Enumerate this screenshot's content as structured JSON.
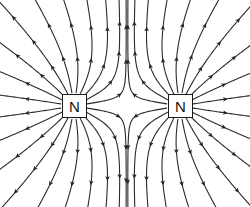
{
  "figure": {
    "name": "magnetic-field-like-poles",
    "background_color": "#ffffff",
    "line_color": "#2b2b2b",
    "width": 250,
    "height": 207
  },
  "poles": [
    {
      "id": "left-pole",
      "label": "N",
      "polarity": "north",
      "cx": 74,
      "cy": 106,
      "box": {
        "x": 62,
        "y": 94,
        "w": 25,
        "h": 24
      },
      "border_color": "#1a1a1a",
      "fill_color": "#ffffff",
      "text_color": "#111111"
    },
    {
      "id": "right-pole",
      "label": "N",
      "polarity": "north",
      "cx": 180,
      "cy": 106,
      "box": {
        "x": 168,
        "y": 94,
        "w": 25,
        "h": 24
      },
      "border_color": "#1a1a1a",
      "fill_color": "#ffffff",
      "text_color": "#111111"
    }
  ],
  "chart_data": {
    "type": "diagram",
    "title": "",
    "subtitle": "",
    "neutral_point": {
      "x": 127,
      "y": 106
    },
    "field_direction": "outward from each north pole",
    "line_count_per_pole": 20,
    "arrow_style": "slender-triangle",
    "stroke_width": 1.1
  }
}
